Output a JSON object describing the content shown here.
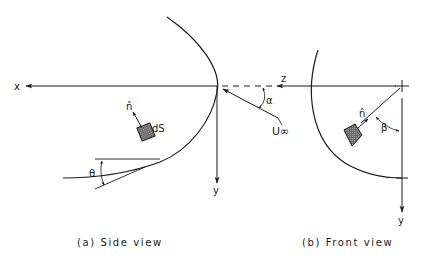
{
  "figure": {
    "panels": [
      {
        "id": "side",
        "caption": "(a) Side view",
        "labels": {
          "x_axis": "x",
          "y_axis": "y",
          "normal": "n̂",
          "surface_element": "dS",
          "angle_theta": "θ",
          "angle_alpha": "α",
          "freestream": "U∞"
        }
      },
      {
        "id": "front",
        "caption": "(b) Front view",
        "labels": {
          "z_axis": "z",
          "y_axis": "y",
          "normal": "n̂",
          "angle_beta": "β"
        }
      }
    ],
    "colors": {
      "ink": "#1a1a1a",
      "element_fill": "#6b6b6b",
      "background": "#ffffff"
    }
  }
}
